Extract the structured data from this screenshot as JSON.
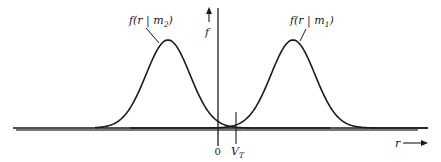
{
  "diagram": {
    "type": "probability-density-plot",
    "curves": [
      {
        "id": "m2",
        "label": "f(r | m2)",
        "label_main": "f(r | m",
        "label_sub": "2",
        "label_close": ")",
        "peak_x": 168,
        "peak_y": 40,
        "sigma": 22
      },
      {
        "id": "m1",
        "label": "f(r | m1)",
        "label_main": "f(r | m",
        "label_sub": "1",
        "label_close": ")",
        "peak_x": 293,
        "peak_y": 40,
        "sigma": 22
      }
    ],
    "axes": {
      "y_label": "f",
      "x_label": "r",
      "origin_label": "0",
      "threshold_label_main": "V",
      "threshold_label_sub": "T"
    },
    "colors": {
      "line": "#1a1a1a",
      "background": "#ffffff"
    }
  }
}
